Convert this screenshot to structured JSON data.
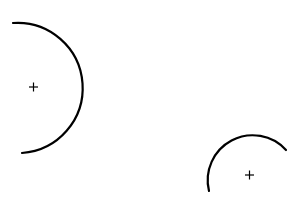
{
  "diagram": {
    "background": "#ffffff",
    "stroke_color": "#000000",
    "arcs": [
      {
        "name": "left-arc",
        "description": "arc opening to the left, center marked with a plus"
      },
      {
        "name": "right-arc",
        "description": "arc opening downward, center marked with a plus"
      }
    ],
    "center_marker_glyph": "+"
  }
}
